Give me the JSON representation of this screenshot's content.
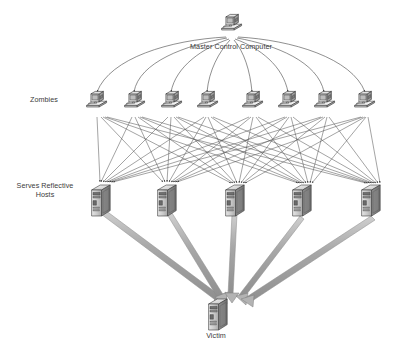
{
  "diagram": {
    "type": "network-attack-topology",
    "background_color": "#ffffff",
    "line_color": "#4d4d4d",
    "thick_arrow_color": "#9a9a9a",
    "text_color": "#3a3a3a",
    "labels": {
      "master": "Master Control Computer",
      "zombies": "Zombies",
      "reflective_hosts": "Serves Reflective\nHosts",
      "victim": "Victim"
    },
    "tiers": [
      {
        "id": "master",
        "label": "Master Control Computer",
        "node_type": "desktop-computer",
        "count": 1,
        "nodes": [
          {
            "id": "master-1",
            "x": 231,
            "y": 24
          }
        ]
      },
      {
        "id": "zombies",
        "label": "Zombies",
        "node_type": "desktop-computer",
        "count": 8,
        "nodes": [
          {
            "id": "zombie-1",
            "x": 96,
            "y": 100
          },
          {
            "id": "zombie-2",
            "x": 134,
            "y": 100
          },
          {
            "id": "zombie-3",
            "x": 171,
            "y": 100
          },
          {
            "id": "zombie-4",
            "x": 207,
            "y": 100
          },
          {
            "id": "zombie-5",
            "x": 252,
            "y": 100
          },
          {
            "id": "zombie-6",
            "x": 288,
            "y": 100
          },
          {
            "id": "zombie-7",
            "x": 324,
            "y": 100
          },
          {
            "id": "zombie-8",
            "x": 364,
            "y": 100
          }
        ]
      },
      {
        "id": "reflective-hosts",
        "label": "Serves Reflective Hosts",
        "node_type": "server-tower",
        "count": 5,
        "nodes": [
          {
            "id": "host-1",
            "x": 101,
            "y": 196
          },
          {
            "id": "host-2",
            "x": 167,
            "y": 196
          },
          {
            "id": "host-3",
            "x": 235,
            "y": 196
          },
          {
            "id": "host-4",
            "x": 302,
            "y": 196
          },
          {
            "id": "host-5",
            "x": 371,
            "y": 196
          }
        ]
      },
      {
        "id": "victim",
        "label": "Victim",
        "node_type": "server-tower",
        "count": 1,
        "nodes": [
          {
            "id": "victim-1",
            "x": 218,
            "y": 307
          }
        ]
      }
    ],
    "edges": {
      "master_to_zombies": {
        "style": "thin-curved-arc",
        "description": "Arcs from master control computer fanning out to each of the eight zombies",
        "count": 8
      },
      "zombies_to_hosts": {
        "style": "thin-straight-arrow",
        "description": "Dense mesh: each zombie sends spoofed requests to multiple reflective hosts",
        "count": 40
      },
      "hosts_to_victim": {
        "style": "thick-3d-block-arrow",
        "description": "Amplified reflected traffic converging from all five reflective hosts onto the victim",
        "count": 5
      }
    }
  }
}
